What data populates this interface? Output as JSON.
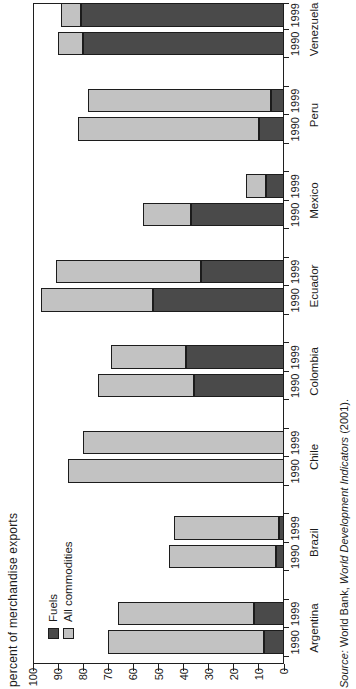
{
  "axis_title": "percent of merchandise exports",
  "legend": {
    "fuels": {
      "label": "Fuels"
    },
    "all": {
      "label": "All commodities"
    }
  },
  "colors": {
    "fuels": "#4a4a4a",
    "all_commodities": "#c2c2c2",
    "frame": "#1f1f1f",
    "background": "#ffffff"
  },
  "source": {
    "prefix_italic": "Source:",
    "middle": " World Bank, ",
    "title_italic": "World Development Indicators",
    "suffix": " (2001)."
  },
  "chart_data": {
    "type": "bar",
    "stacked": true,
    "rotation": "entire chart rotated 90 degrees counter-clockwise on the page",
    "ylabel": "percent of merchandise exports",
    "ylim": [
      0,
      100
    ],
    "ytick_step": 10,
    "grid": false,
    "legend_position": "top-left inside plot",
    "bars_per_category": [
      "1990",
      "1999"
    ],
    "series_note": "total bar length = All commodities share; dark segment at base = Fuels share",
    "categories": [
      "Argentina",
      "Brazil",
      "Chile",
      "Colombia",
      "Ecuador",
      "Mexico",
      "Peru",
      "Venezuela"
    ],
    "countries": [
      {
        "name": "Argentina",
        "bars": [
          {
            "year": "1990",
            "fuels": 8,
            "all_commodities": 70
          },
          {
            "year": "1999",
            "fuels": 12,
            "all_commodities": 66
          }
        ]
      },
      {
        "name": "Brazil",
        "bars": [
          {
            "year": "1990",
            "fuels": 3,
            "all_commodities": 46
          },
          {
            "year": "1999",
            "fuels": 2,
            "all_commodities": 44
          }
        ]
      },
      {
        "name": "Chile",
        "bars": [
          {
            "year": "1990",
            "fuels": 0,
            "all_commodities": 86
          },
          {
            "year": "1999",
            "fuels": 0,
            "all_commodities": 80
          }
        ]
      },
      {
        "name": "Colombia",
        "bars": [
          {
            "year": "1990",
            "fuels": 36,
            "all_commodities": 74
          },
          {
            "year": "1999",
            "fuels": 39,
            "all_commodities": 69
          }
        ]
      },
      {
        "name": "Ecuador",
        "bars": [
          {
            "year": "1990",
            "fuels": 52,
            "all_commodities": 97
          },
          {
            "year": "1999",
            "fuels": 33,
            "all_commodities": 91
          }
        ]
      },
      {
        "name": "Mexico",
        "bars": [
          {
            "year": "1990",
            "fuels": 37,
            "all_commodities": 56
          },
          {
            "year": "1999",
            "fuels": 7,
            "all_commodities": 15
          }
        ]
      },
      {
        "name": "Peru",
        "bars": [
          {
            "year": "1990",
            "fuels": 10,
            "all_commodities": 82
          },
          {
            "year": "1999",
            "fuels": 5,
            "all_commodities": 78
          }
        ]
      },
      {
        "name": "Venezuela",
        "bars": [
          {
            "year": "1990",
            "fuels": 80,
            "all_commodities": 90
          },
          {
            "year": "1999",
            "fuels": 81,
            "all_commodities": 89
          }
        ]
      }
    ]
  }
}
